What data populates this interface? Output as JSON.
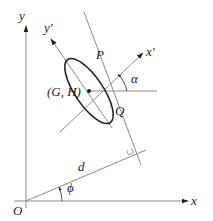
{
  "diagram": {
    "type": "geometry",
    "colors": {
      "line": "#8a8a8a",
      "ellipse": "#222222",
      "text": "#222222",
      "background": "#ffffff"
    },
    "labels": {
      "x_axis": "x",
      "y_axis": "y",
      "x_prime": "x′",
      "y_prime": "y′",
      "origin": "O",
      "center": "(G, H)",
      "point_p": "P",
      "point_q": "Q",
      "angle_alpha": "α",
      "angle_phi": "ϕ",
      "distance": "d"
    }
  }
}
